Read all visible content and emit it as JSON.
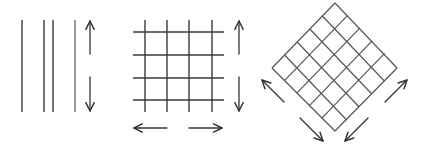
{
  "diagram": {
    "colors": {
      "stroke": "#3a3a3a",
      "background": "#ffffff"
    },
    "panels": [
      {
        "id": "parallel-lines",
        "vertical_lines_x": [
          22,
          44,
          53,
          75
        ],
        "y_range": [
          20,
          112
        ],
        "arrows": [
          "vertical-up",
          "vertical-down"
        ]
      },
      {
        "id": "square-grid",
        "vertical_lines_x": [
          145,
          167,
          189,
          212
        ],
        "horizontal_lines_y": [
          32,
          55,
          78,
          100
        ],
        "arrows": [
          "vertical-up",
          "vertical-down",
          "horizontal-left",
          "horizontal-right"
        ]
      },
      {
        "id": "diamond-grid",
        "corners": {
          "top": [
            335,
            3
          ],
          "left": [
            272,
            68
          ],
          "right": [
            397,
            68
          ],
          "bottom": [
            335,
            131
          ]
        },
        "divisions": 5,
        "arrows": [
          "up-left",
          "down-right",
          "down-left",
          "up-right"
        ]
      }
    ]
  }
}
